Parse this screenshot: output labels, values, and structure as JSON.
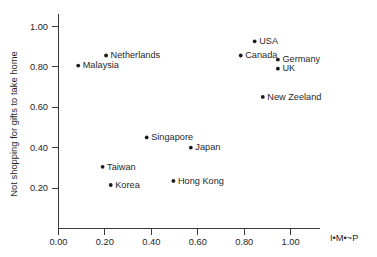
{
  "chart_data": {
    "type": "scatter",
    "title": "",
    "xlabel": "I•M•~P",
    "ylabel": "Not shopping for gifts to take home",
    "xlim": [
      0.0,
      1.12
    ],
    "ylim": [
      0.0,
      1.06
    ],
    "xticks": [
      0.0,
      0.2,
      0.4,
      0.6,
      0.8,
      1.0
    ],
    "xtick_labels": [
      "0.00",
      "0.20",
      "0.40",
      "0.60",
      "0.80",
      "1.00"
    ],
    "yticks": [
      0.2,
      0.4,
      0.6,
      0.8,
      1.0
    ],
    "ytick_labels": [
      "0.20",
      "0.40",
      "0.60",
      "0.80",
      "1.00"
    ],
    "grid": false,
    "legend": "none",
    "marker_color": "#1a1a1a",
    "axis_color": "#3a3a3a",
    "points": [
      {
        "label": "Malaysia",
        "x": 0.085,
        "y": 0.805,
        "label_side": "right"
      },
      {
        "label": "Netherlands",
        "x": 0.205,
        "y": 0.855,
        "label_side": "right"
      },
      {
        "label": "USA",
        "x": 0.845,
        "y": 0.925,
        "label_side": "right"
      },
      {
        "label": "Canada",
        "x": 0.785,
        "y": 0.855,
        "label_side": "right"
      },
      {
        "label": "Germany",
        "x": 0.945,
        "y": 0.835,
        "label_side": "right"
      },
      {
        "label": "UK",
        "x": 0.945,
        "y": 0.79,
        "label_side": "right"
      },
      {
        "label": "New Zeeland",
        "x": 0.88,
        "y": 0.65,
        "label_side": "right"
      },
      {
        "label": "Singapore",
        "x": 0.38,
        "y": 0.45,
        "label_side": "right"
      },
      {
        "label": "Japan",
        "x": 0.57,
        "y": 0.4,
        "label_side": "right"
      },
      {
        "label": "Taiwan",
        "x": 0.19,
        "y": 0.305,
        "label_side": "right"
      },
      {
        "label": "Korea",
        "x": 0.225,
        "y": 0.215,
        "label_side": "right"
      },
      {
        "label": "Hong Kong",
        "x": 0.495,
        "y": 0.235,
        "label_side": "right"
      }
    ]
  }
}
